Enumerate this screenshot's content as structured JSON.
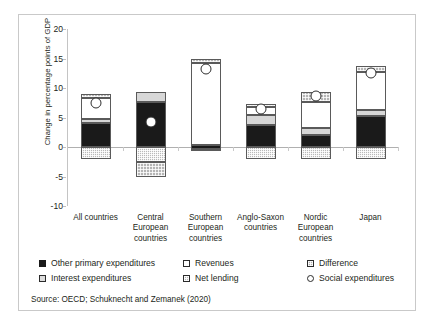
{
  "chart_data": {
    "type": "bar",
    "subtype": "stacked-bar-with-scatter-overlay",
    "title": "",
    "xlabel": "",
    "ylabel": "Change in percentage points of GDP",
    "ylim": [
      -10,
      20
    ],
    "yticks": [
      -10,
      -5,
      0,
      5,
      10,
      15,
      20
    ],
    "ytick_labels": [
      "-10",
      "-5",
      "0",
      "5",
      "10",
      "15",
      "20"
    ],
    "grid": false,
    "legend_position": "bottom",
    "categories": [
      "All countries",
      "Central European countries",
      "Southern European countries",
      "Anglo-Saxon countries",
      "Nordic European countries",
      "Japan"
    ],
    "category_label_lines": [
      [
        "All countries"
      ],
      [
        "Central",
        "European",
        "countries"
      ],
      [
        "Southern",
        "European",
        "countries"
      ],
      [
        "Anglo-Saxon",
        "countries"
      ],
      [
        "Nordic",
        "European",
        "countries"
      ],
      [
        "Japan"
      ]
    ],
    "series": [
      {
        "name": "Other primary expenditures",
        "pattern": "solid-black",
        "color": "#1a1a1a",
        "values": [
          4.0,
          7.6,
          1.0,
          3.7,
          2.0,
          5.2
        ]
      },
      {
        "name": "Interest expenditures",
        "pattern": "light-grey",
        "color": "#d7d7d7",
        "values": [
          0.8,
          1.7,
          0.0,
          1.8,
          1.3,
          1.1
        ]
      },
      {
        "name": "Revenues",
        "pattern": "white",
        "color": "#ffffff",
        "values": [
          3.5,
          0.0,
          13.9,
          1.3,
          4.3,
          6.4
        ]
      },
      {
        "name": "Net lending",
        "pattern": "fine-checker-grey",
        "color": "#b9b9b9",
        "values": [
          -2.0,
          -2.5,
          -0.7,
          -2.0,
          -2.0,
          -2.0
        ]
      },
      {
        "name": "Difference",
        "pattern": "coarse-checker-grey",
        "color": "#b5b5b5",
        "values": [
          0.7,
          -2.5,
          0.7,
          0.5,
          1.7,
          1.0
        ]
      }
    ],
    "overlay_series": {
      "name": "Social expenditures",
      "marker": "open-circle",
      "values": [
        7.5,
        4.3,
        13.2,
        6.5,
        8.7,
        12.5
      ]
    },
    "stack_segments": [
      {
        "category": "All countries",
        "segments": [
          {
            "name": "Net lending",
            "from": -2.0,
            "to": 0.0
          },
          {
            "name": "Other primary expenditures",
            "from": 0.0,
            "to": 4.0
          },
          {
            "name": "Interest expenditures",
            "from": 4.0,
            "to": 4.8
          },
          {
            "name": "Revenues",
            "from": 4.8,
            "to": 8.3
          },
          {
            "name": "Difference",
            "from": 8.3,
            "to": 9.0
          }
        ],
        "social_expenditures": 7.5
      },
      {
        "category": "Central European countries",
        "segments": [
          {
            "name": "Difference",
            "from": -5.0,
            "to": -2.5
          },
          {
            "name": "Net lending",
            "from": -2.5,
            "to": 0.0
          },
          {
            "name": "Other primary expenditures",
            "from": 0.0,
            "to": 7.6
          },
          {
            "name": "Interest expenditures",
            "from": 7.6,
            "to": 9.3
          }
        ],
        "social_expenditures": 4.3
      },
      {
        "category": "Southern European countries",
        "segments": [
          {
            "name": "Net lending",
            "from": -0.7,
            "to": -0.3
          },
          {
            "name": "Other primary expenditures",
            "from": -0.3,
            "to": 0.3
          },
          {
            "name": "Revenues",
            "from": 0.3,
            "to": 14.2
          },
          {
            "name": "Difference",
            "from": 14.2,
            "to": 14.9
          }
        ],
        "social_expenditures": 13.2
      },
      {
        "category": "Anglo-Saxon countries",
        "segments": [
          {
            "name": "Net lending",
            "from": -2.0,
            "to": 0.0
          },
          {
            "name": "Other primary expenditures",
            "from": 0.0,
            "to": 3.7
          },
          {
            "name": "Interest expenditures",
            "from": 3.7,
            "to": 5.5
          },
          {
            "name": "Revenues",
            "from": 5.5,
            "to": 6.8
          },
          {
            "name": "Difference",
            "from": 6.8,
            "to": 7.3
          }
        ],
        "social_expenditures": 6.5
      },
      {
        "category": "Nordic European countries",
        "segments": [
          {
            "name": "Net lending",
            "from": -2.0,
            "to": 0.0
          },
          {
            "name": "Other primary expenditures",
            "from": 0.0,
            "to": 2.0
          },
          {
            "name": "Interest expenditures",
            "from": 2.0,
            "to": 3.3
          },
          {
            "name": "Revenues",
            "from": 3.3,
            "to": 7.6
          },
          {
            "name": "Difference",
            "from": 7.6,
            "to": 9.3
          }
        ],
        "social_expenditures": 8.7
      },
      {
        "category": "Japan",
        "segments": [
          {
            "name": "Net lending",
            "from": -2.0,
            "to": 0.0
          },
          {
            "name": "Other primary expenditures",
            "from": 0.0,
            "to": 5.2
          },
          {
            "name": "Interest expenditures",
            "from": 5.2,
            "to": 6.3
          },
          {
            "name": "Revenues",
            "from": 6.3,
            "to": 12.7
          },
          {
            "name": "Difference",
            "from": 12.7,
            "to": 13.7
          }
        ],
        "social_expenditures": 12.5
      }
    ]
  },
  "legend": {
    "items": [
      {
        "label": "Other primary expenditures",
        "swatch": "other-primary-expenditures-swatch"
      },
      {
        "label": "Interest expenditures",
        "swatch": "interest-expenditures-swatch"
      },
      {
        "label": "Revenues",
        "swatch": "revenues-swatch"
      },
      {
        "label": "Net lending",
        "swatch": "net-lending-swatch"
      },
      {
        "label": "Difference",
        "swatch": "difference-swatch"
      },
      {
        "label": "Social expenditures",
        "swatch": "social-expenditures-swatch"
      }
    ]
  },
  "source": {
    "text": "Source: OECD; Schuknecht and Zemanek (2020)"
  },
  "colors": {
    "other_primary": "#1a1a1a",
    "interest": "#d7d7d7",
    "revenues": "#ffffff",
    "net_lending": "#b9b9b9",
    "difference": "#b5b5b5",
    "axis": "#b0b0b0",
    "text": "#231f20",
    "frame": "#c9c9c9"
  }
}
